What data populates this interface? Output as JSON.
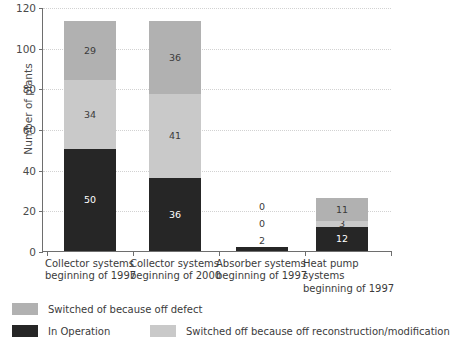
{
  "chart_data": {
    "type": "bar",
    "stacked": true,
    "title": "",
    "xlabel": "",
    "ylabel": "Number of plants",
    "ylim": [
      0,
      120
    ],
    "yticks": [
      0,
      20,
      40,
      60,
      80,
      100,
      120
    ],
    "grid": true,
    "legend_position": "bottom-left",
    "categories": [
      "Collector systems beginning of 1997",
      "Collector systems beginning of 2000",
      "Absorber systems beginning of 1997",
      "Heat pump systems beginning of 1997"
    ],
    "category_lines": [
      [
        "Collector systems",
        "beginning of 1997"
      ],
      [
        "Collector systems",
        "beginning of 2000"
      ],
      [
        "Absorber systems",
        "beginning of 1997"
      ],
      [
        "Heat pump",
        "systems",
        "beginning of 1997"
      ]
    ],
    "series": [
      {
        "name": "In Operation",
        "color": "#262626",
        "values": [
          50,
          36,
          2,
          12
        ]
      },
      {
        "name": "Switched off because off reconstruction/modification",
        "color": "#c9c9c9",
        "values": [
          34,
          41,
          0,
          3
        ]
      },
      {
        "name": "Switched of because off defect",
        "color": "#b1b1b1",
        "values": [
          29,
          36,
          0,
          11
        ]
      }
    ],
    "totals": [
      113,
      113,
      2,
      26
    ]
  },
  "legend": {
    "items": [
      {
        "label": "Switched of because off defect",
        "swatch": "#b1b1b1"
      },
      {
        "label": "In Operation",
        "swatch": "#262626"
      },
      {
        "label": "Switched off because off reconstruction/modification",
        "swatch": "#c9c9c9"
      }
    ]
  },
  "axis": {
    "y_title": "Number of plants",
    "y_tick_labels": [
      "0",
      "20",
      "40",
      "60",
      "80",
      "100",
      "120"
    ]
  }
}
